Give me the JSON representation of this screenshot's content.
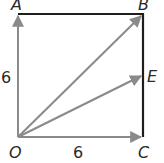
{
  "diagram": {
    "type": "geometry-square-vectors",
    "points": {
      "O": {
        "label": "O",
        "x": 18,
        "y": 137
      },
      "A": {
        "label": "A",
        "x": 18,
        "y": 14
      },
      "B": {
        "label": "B",
        "x": 143,
        "y": 14
      },
      "C": {
        "label": "C",
        "x": 143,
        "y": 137
      },
      "E": {
        "label": "E",
        "x": 143,
        "y": 75
      }
    },
    "side_labels": {
      "OA": "6",
      "OC": "6"
    },
    "colors": {
      "vector": "#8a8a8a",
      "edge": "#1e1e1e",
      "text": "#2a2a2a"
    },
    "vectors": [
      "OA",
      "OC",
      "OB",
      "OE"
    ],
    "edges": [
      "AB",
      "BC"
    ]
  }
}
